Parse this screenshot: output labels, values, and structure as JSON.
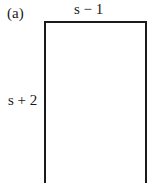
{
  "figure": {
    "part_label": "(a)",
    "shape": "rectangle",
    "top_side_label": "s − 1",
    "left_side_label": "s + 2"
  }
}
